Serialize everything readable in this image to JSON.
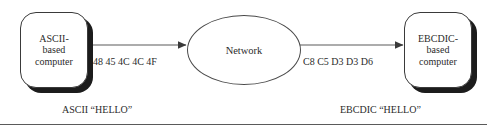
{
  "diagram": {
    "background_color": "#ffffff",
    "line_color": "#5a5a5a",
    "text_color": "#2b2b2b",
    "shadow_color": "#1c1c1c",
    "nodes": {
      "source": {
        "name": "ascii-computer",
        "lines": [
          "ASCII-",
          "based",
          "computer"
        ],
        "text": "ASCII- based computer"
      },
      "network": {
        "name": "network",
        "label": "Network"
      },
      "destination": {
        "name": "ebcdic-computer",
        "lines": [
          "EBCDIC-",
          "based",
          "computer"
        ],
        "text": "EBCDIC- based computer"
      }
    },
    "edges": [
      {
        "name": "ascii-to-network",
        "label": "48 45 4C 4C 4F",
        "direction": "right",
        "arrowhead": "solid-triangle"
      },
      {
        "name": "network-to-ebcdic",
        "label": "C8 C5 D3 D3 D6",
        "direction": "right",
        "arrowhead": "solid-triangle"
      }
    ],
    "captions": {
      "left": "ASCII “HELLO”",
      "right": "EBCDIC “HELLO”"
    }
  }
}
